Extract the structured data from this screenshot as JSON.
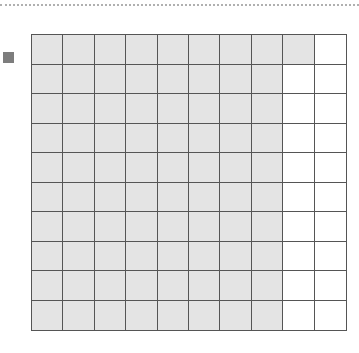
{
  "diagram": {
    "type": "hundred-grid",
    "rows": 10,
    "cols": 10,
    "shaded_per_row": [
      9,
      8,
      8,
      8,
      8,
      8,
      8,
      8,
      8,
      8
    ],
    "shaded_total": 81,
    "colors": {
      "shaded": "#e4e4e4",
      "unshaded": "#ffffff",
      "grid_line": "#555555",
      "legend_swatch": "#7d7d7d"
    }
  },
  "legend": {
    "icon": "square-swatch"
  }
}
